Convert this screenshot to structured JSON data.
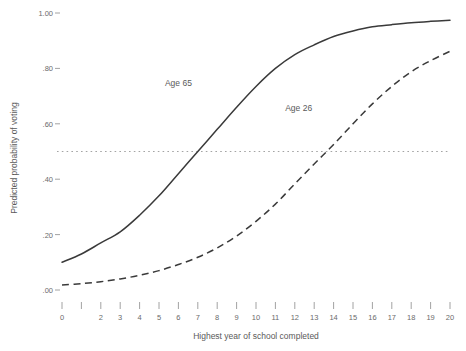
{
  "chart_data": {
    "type": "line",
    "title": "",
    "xlabel": "Highest year of school completed",
    "ylabel": "Predicted probability of voting",
    "xlim": [
      0,
      20
    ],
    "ylim": [
      0.0,
      1.0
    ],
    "grid": false,
    "legend": "inline annotations",
    "x_tick_labels": [
      "0",
      "2",
      "3",
      "4",
      "5",
      "6",
      "7",
      "8",
      "9",
      "10",
      "11",
      "12",
      "13",
      "14",
      "15",
      "16",
      "17",
      "18",
      "19",
      "20"
    ],
    "x_tick_values": [
      0,
      2,
      3,
      4,
      5,
      6,
      7,
      8,
      9,
      10,
      11,
      12,
      13,
      14,
      15,
      16,
      17,
      18,
      19,
      20
    ],
    "y_tick_labels": [
      "1.00",
      "0.80",
      "0.60",
      "0.40",
      "0.20",
      "0.00"
    ],
    "y_tick_values": [
      1.0,
      0.8,
      0.6,
      0.4,
      0.2,
      0.0
    ],
    "y_tick_display": [
      "1.00",
      ".80",
      ".60",
      ".40",
      ".20",
      ".00"
    ],
    "x": [
      0,
      1,
      2,
      3,
      4,
      5,
      6,
      7,
      8,
      9,
      10,
      11,
      12,
      13,
      14,
      15,
      16,
      17,
      18,
      19,
      20
    ],
    "series": [
      {
        "name": "Age 65",
        "style": "solid",
        "color": "#3a3a3a",
        "annotation": "Age 65",
        "annotation_x": 6.0,
        "annotation_y": 0.735,
        "values": [
          0.1,
          0.13,
          0.17,
          0.21,
          0.27,
          0.34,
          0.42,
          0.5,
          0.58,
          0.66,
          0.735,
          0.8,
          0.85,
          0.885,
          0.915,
          0.935,
          0.95,
          0.958,
          0.965,
          0.97,
          0.974
        ]
      },
      {
        "name": "Age 26",
        "style": "dashed",
        "color": "#3a3a3a",
        "annotation": "Age 26",
        "annotation_x": 12.2,
        "annotation_y": 0.645,
        "values": [
          0.018,
          0.023,
          0.03,
          0.04,
          0.053,
          0.07,
          0.092,
          0.118,
          0.152,
          0.195,
          0.248,
          0.31,
          0.383,
          0.455,
          0.525,
          0.6,
          0.672,
          0.735,
          0.788,
          0.828,
          0.862
        ]
      }
    ],
    "reference_line": {
      "name": "probability 0.50 reference",
      "orientation": "horizontal",
      "y": 0.5,
      "style": "dotted",
      "color": "#9a9a9a"
    }
  }
}
